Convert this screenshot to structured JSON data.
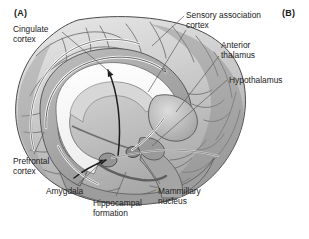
{
  "figure": {
    "kind": "anatomical-illustration",
    "background_color": "#ffffff",
    "ink_color": "#222222",
    "panels": [
      {
        "id": "A",
        "label": "(A)"
      },
      {
        "id": "B",
        "label": "(B)"
      }
    ],
    "labels": [
      {
        "id": "cingulate-cortex",
        "text": "Cingulate\ncortex"
      },
      {
        "id": "sensory-association-cortex",
        "text": "Sensory association\ncortex"
      },
      {
        "id": "anterior-thalamus",
        "text": "Anterior\nthalamus"
      },
      {
        "id": "hypothalamus",
        "text": "Hypothalamus"
      },
      {
        "id": "prefrontal-cortex",
        "text": "Prefrontal\ncortex"
      },
      {
        "id": "amygdala",
        "text": "Amygdala"
      },
      {
        "id": "hippocampal-formation",
        "text": "Hippocampal\nformation"
      },
      {
        "id": "mammillary-nucleus",
        "text": "Mammillary\nnucleus"
      }
    ]
  }
}
